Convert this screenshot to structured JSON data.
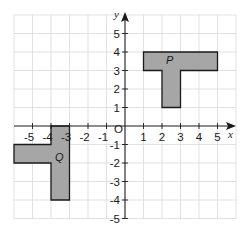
{
  "diagram": {
    "type": "coordinate-grid",
    "axes": {
      "x_label": "x",
      "y_label": "y",
      "origin_label": "O",
      "x_ticks": [
        "-5",
        "-4",
        "-3",
        "-2",
        "-1",
        "1",
        "2",
        "3",
        "4",
        "5"
      ],
      "y_ticks_positive": [
        "5",
        "4",
        "3",
        "2",
        "1"
      ],
      "y_ticks_negative": [
        "-1",
        "-2",
        "-3",
        "-4",
        "-5"
      ],
      "x_range": [
        -6,
        6
      ],
      "y_range": [
        -5,
        6
      ]
    },
    "shapes": [
      {
        "name": "P",
        "fill": "#a6a6a6",
        "vertices": [
          [
            1,
            4
          ],
          [
            5,
            4
          ],
          [
            5,
            3
          ],
          [
            3,
            3
          ],
          [
            3,
            1
          ],
          [
            2,
            1
          ],
          [
            2,
            3
          ],
          [
            1,
            3
          ]
        ]
      },
      {
        "name": "Q",
        "fill": "#a6a6a6",
        "vertices": [
          [
            -4,
            0
          ],
          [
            -3,
            0
          ],
          [
            -3,
            -4
          ],
          [
            -4,
            -4
          ],
          [
            -4,
            -2
          ],
          [
            -6,
            -2
          ],
          [
            -6,
            -1
          ],
          [
            -4,
            -1
          ]
        ]
      }
    ]
  }
}
